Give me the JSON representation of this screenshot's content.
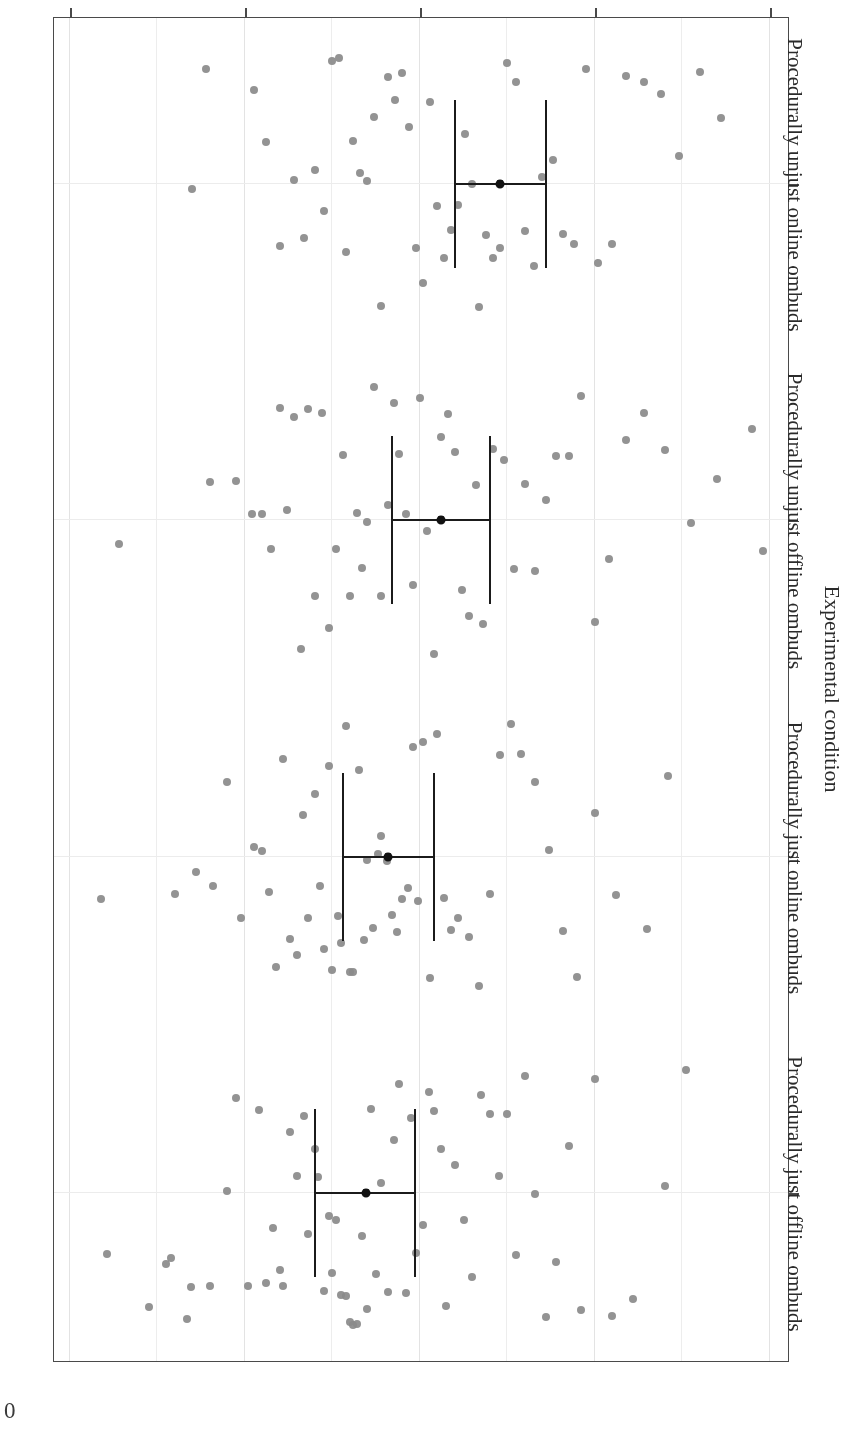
{
  "figure": {
    "page_marker": "0"
  },
  "chart_data": {
    "type": "scatter",
    "title": "",
    "xlabel": "Experimental condition",
    "ylabel": "Outcome fairness perceptions",
    "orientation": "rotated-180",
    "grid": true,
    "legend": "none",
    "ylim": [
      -2.0,
      2.0
    ],
    "ytick_labels": [
      "2",
      "1",
      "0",
      "-1",
      "-2"
    ],
    "ytick_values": [
      2,
      1,
      0,
      -1,
      -2
    ],
    "minor_gridline_step": 0.5,
    "categories": [
      "Procedurally just offline ombuds",
      "Procedurally just online ombuds",
      "Procedurally unjust offline ombuds",
      "Procedurally unjust online ombuds"
    ],
    "series": [
      {
        "name": "Mean with 95% CI",
        "means": [
          0.31,
          0.18,
          -0.12,
          -0.46
        ],
        "ci_low": [
          0.03,
          -0.08,
          -0.4,
          -0.72
        ],
        "ci_high": [
          0.6,
          0.44,
          0.16,
          -0.2
        ]
      }
    ],
    "points": {
      "Procedurally just offline ombuds": [
        1.79,
        1.55,
        1.45,
        1.42,
        1.33,
        1.31,
        1.2,
        1.1,
        1.05,
        0.98,
        0.92,
        0.88,
        0.84,
        0.8,
        0.78,
        0.74,
        0.7,
        0.66,
        0.64,
        0.6,
        0.58,
        0.55,
        0.52,
        0.5,
        0.48,
        0.45,
        0.42,
        0.4,
        0.38,
        0.36,
        0.33,
        0.3,
        0.28,
        0.25,
        0.22,
        0.18,
        0.15,
        0.12,
        0.08,
        0.05,
        0.02,
        -0.02,
        -0.05,
        -0.08,
        -0.12,
        -0.15,
        -0.2,
        -0.25,
        -0.3,
        -0.35,
        -0.4,
        -0.45,
        -0.5,
        -0.55,
        -0.6,
        -0.66,
        -0.72,
        -0.78,
        -0.85,
        -0.92,
        -1.0,
        -1.1,
        -1.22,
        -1.4,
        -1.52
      ],
      "Procedurally just online ombuds": [
        1.82,
        1.4,
        1.28,
        1.18,
        1.1,
        1.02,
        0.95,
        0.9,
        0.86,
        0.82,
        0.78,
        0.74,
        0.7,
        0.67,
        0.64,
        0.6,
        0.57,
        0.55,
        0.52,
        0.5,
        0.47,
        0.45,
        0.42,
        0.4,
        0.38,
        0.35,
        0.32,
        0.3,
        0.27,
        0.24,
        0.22,
        0.19,
        0.16,
        0.13,
        0.1,
        0.07,
        0.04,
        0.01,
        -0.02,
        -0.06,
        -0.1,
        -0.14,
        -0.18,
        -0.22,
        -0.28,
        -0.34,
        -0.4,
        -0.46,
        -0.52,
        -0.58,
        -0.66,
        -0.74,
        -0.82,
        -0.9,
        -1.0,
        -1.12,
        -1.3,
        -1.42
      ],
      "Procedurally unjust offline ombuds": [
        1.72,
        1.2,
        1.05,
        0.96,
        0.9,
        0.85,
        0.8,
        0.76,
        0.72,
        0.68,
        0.64,
        0.6,
        0.56,
        0.52,
        0.48,
        0.44,
        0.4,
        0.36,
        0.33,
        0.3,
        0.26,
        0.22,
        0.18,
        0.15,
        0.12,
        0.08,
        0.04,
        0.0,
        -0.04,
        -0.08,
        -0.12,
        -0.16,
        -0.2,
        -0.24,
        -0.28,
        -0.32,
        -0.36,
        -0.42,
        -0.48,
        -0.54,
        -0.6,
        -0.66,
        -0.72,
        -0.78,
        -0.85,
        -0.92,
        -1.0,
        -1.08,
        -1.18,
        -1.28,
        -1.4,
        -1.55,
        -1.7,
        -1.9,
        -1.96
      ],
      "Procedurally unjust online ombuds": [
        1.3,
        1.22,
        0.95,
        0.88,
        0.8,
        0.72,
        0.66,
        0.6,
        0.55,
        0.5,
        0.46,
        0.42,
        0.38,
        0.34,
        0.3,
        0.26,
        0.22,
        0.18,
        0.14,
        0.1,
        0.06,
        0.02,
        -0.02,
        -0.06,
        -0.1,
        -0.14,
        -0.18,
        -0.22,
        -0.26,
        -0.3,
        -0.34,
        -0.38,
        -0.42,
        -0.46,
        -0.5,
        -0.55,
        -0.6,
        -0.65,
        -0.7,
        -0.76,
        -0.82,
        -0.88,
        -0.95,
        -1.02,
        -1.1,
        -1.18,
        -1.28,
        -1.38,
        -1.48,
        -1.6,
        -1.72
      ]
    }
  }
}
